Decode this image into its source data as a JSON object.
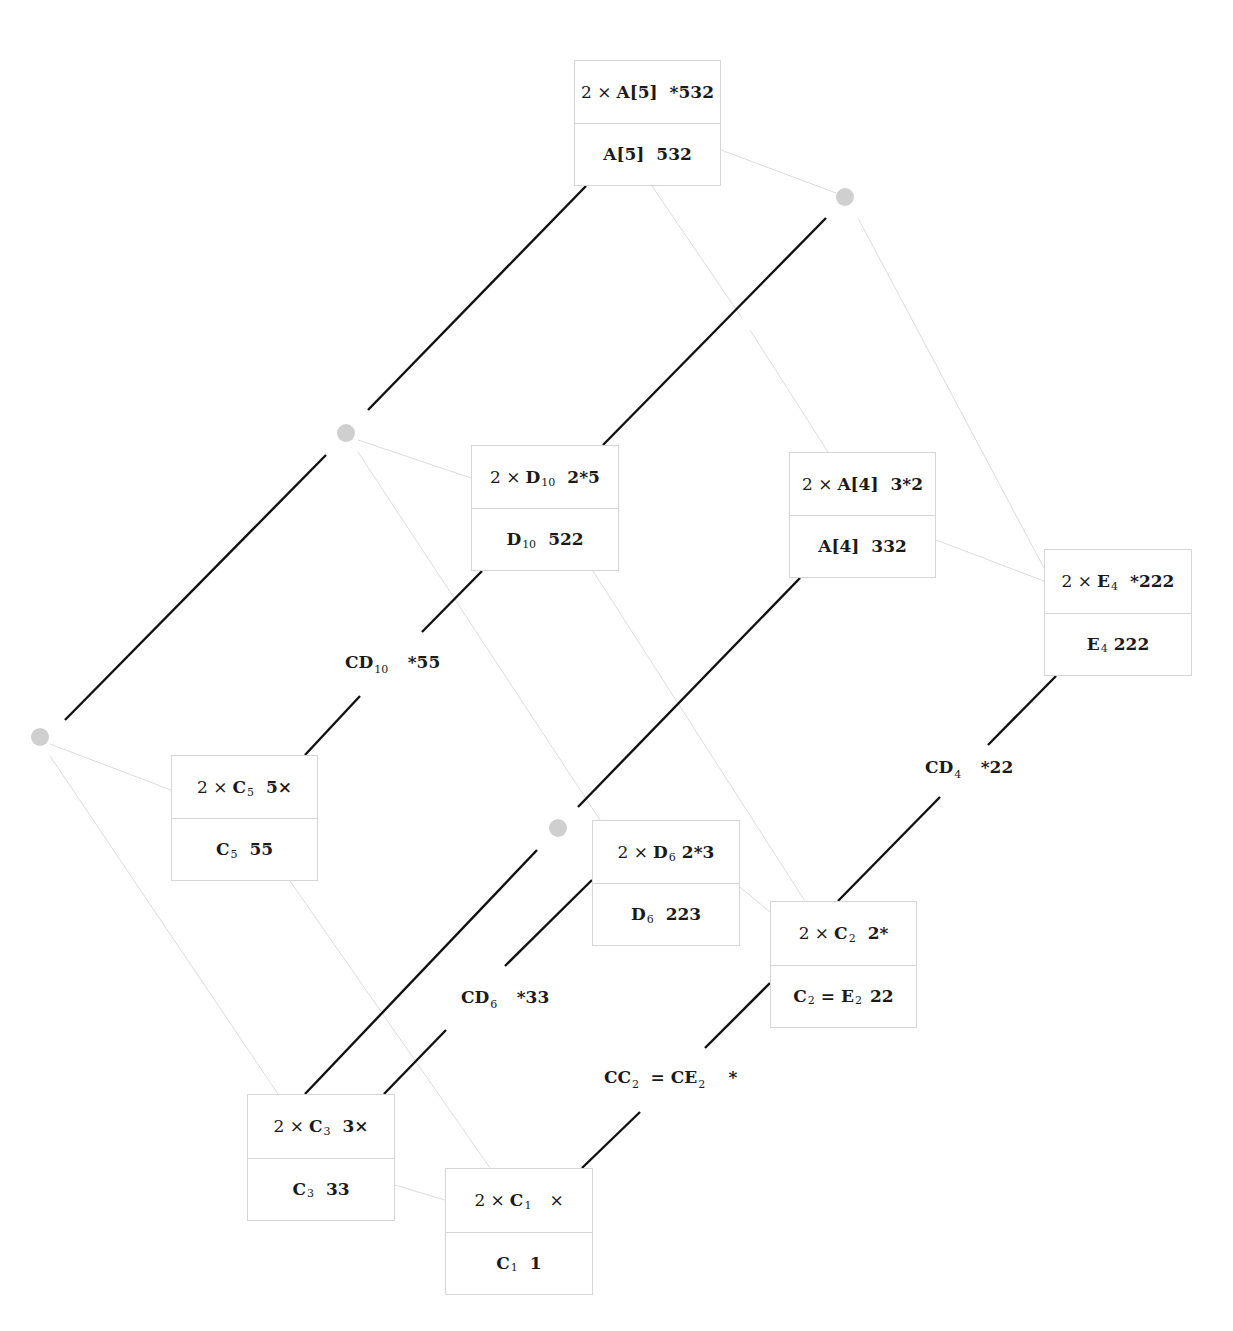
{
  "diagram": {
    "nodes": [
      {
        "id": "A5",
        "top": {
          "prefix": "2 ×",
          "sym": "A[5]",
          "sub": "",
          "val": "*532"
        },
        "bottom": {
          "sym": "A[5]",
          "sub": "",
          "val": "532"
        }
      },
      {
        "id": "D10",
        "top": {
          "prefix": "2 ×",
          "sym": "D",
          "sub": "10",
          "val": "2*5"
        },
        "bottom": {
          "sym": "D",
          "sub": "10",
          "val": "522"
        }
      },
      {
        "id": "A4",
        "top": {
          "prefix": "2 ×",
          "sym": "A[4]",
          "sub": "",
          "val": "3*2"
        },
        "bottom": {
          "sym": "A[4]",
          "sub": "",
          "val": "332"
        }
      },
      {
        "id": "E4",
        "top": {
          "prefix": "2 ×",
          "sym": "E",
          "sub": "4",
          "val": "*222"
        },
        "bottom": {
          "sym": "E",
          "sub": "4",
          "val": "222"
        }
      },
      {
        "id": "C5",
        "top": {
          "prefix": "2 ×",
          "sym": "C",
          "sub": "5",
          "val": "5×"
        },
        "bottom": {
          "sym": "C",
          "sub": "5",
          "val": "55"
        }
      },
      {
        "id": "D6",
        "top": {
          "prefix": "2 ×",
          "sym": "D",
          "sub": "6",
          "val": "2*3"
        },
        "bottom": {
          "sym": "D",
          "sub": "6",
          "val": "223"
        }
      },
      {
        "id": "C2",
        "top": {
          "prefix": "2 ×",
          "sym": "C",
          "sub": "2",
          "val": "2*"
        },
        "bottom": {
          "sym": "C",
          "sub": "2",
          "eq": "= E",
          "eqsub": "2",
          "val": "22"
        }
      },
      {
        "id": "C3",
        "top": {
          "prefix": "2 ×",
          "sym": "C",
          "sub": "3",
          "val": "3×"
        },
        "bottom": {
          "sym": "C",
          "sub": "3",
          "val": "33"
        }
      },
      {
        "id": "C1",
        "top": {
          "prefix": "2 ×",
          "sym": "C",
          "sub": "1",
          "val": "×"
        },
        "bottom": {
          "sym": "C",
          "sub": "1",
          "val": "1"
        }
      }
    ],
    "edge_labels": [
      {
        "id": "CD10",
        "sym": "CD",
        "sub": "10",
        "val": "*55"
      },
      {
        "id": "CD4",
        "sym": "CD",
        "sub": "4",
        "val": "*22"
      },
      {
        "id": "CD6",
        "sym": "CD",
        "sub": "6",
        "val": "*33"
      },
      {
        "id": "CC2",
        "sym": "CC",
        "sub": "2",
        "eq": "= CE",
        "eqsub": "2",
        "val": "*"
      }
    ],
    "colors": {
      "thick_edge": "#111111",
      "thin_edge": "#dcdcdc",
      "dot": "#cfcfcf",
      "box_border": "#d6d6d6"
    }
  }
}
